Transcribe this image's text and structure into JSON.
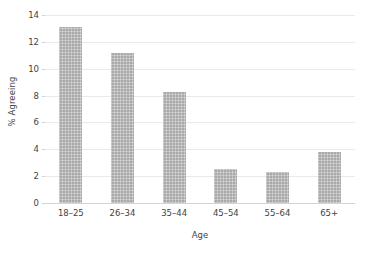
{
  "chart_data": {
    "type": "bar",
    "title": "",
    "subtitle": "",
    "xlabel": "Age",
    "ylabel": "% Agreeing",
    "categories": [
      "18–25",
      "26–34",
      "35–44",
      "45–54",
      "55–64",
      "65+"
    ],
    "values": [
      13.1,
      11.2,
      8.3,
      2.5,
      2.3,
      3.8
    ],
    "series": [
      {
        "name": "% Agreeing",
        "values": [
          13.1,
          11.2,
          8.3,
          2.5,
          2.3,
          3.8
        ]
      }
    ],
    "ylim": [
      0,
      14
    ],
    "ytick_step": 2,
    "yticks": [
      "14",
      "12",
      "10",
      "8",
      "6",
      "4",
      "2",
      "0"
    ],
    "ytick_values": [
      14,
      12,
      10,
      8,
      6,
      4,
      2,
      0
    ],
    "grid": "horizontal",
    "legend": "none",
    "bar_color": "#a9a9a9",
    "gridline_color": "#eaeaea",
    "axis_color": "#d4d4d4",
    "text_color": "#3f3f3f",
    "background_color": "#ffffff"
  }
}
